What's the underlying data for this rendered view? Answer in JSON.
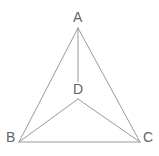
{
  "figure": {
    "background_color": "#ffffff",
    "line_color": "#9a9a9a",
    "label_color": "#646464",
    "line_width": 1,
    "labels": {
      "A": "A",
      "B": "B",
      "C": "C",
      "D": "D"
    },
    "points": {
      "A": {
        "x": 78,
        "y": 28
      },
      "B": {
        "x": 19,
        "y": 142
      },
      "C": {
        "x": 140,
        "y": 142
      },
      "D": {
        "x": 78,
        "y": 99
      }
    },
    "segments": [
      {
        "name": "AB",
        "from": "A",
        "to": "B"
      },
      {
        "name": "AC",
        "from": "A",
        "to": "C"
      },
      {
        "name": "BC",
        "from": "B",
        "to": "C"
      },
      {
        "name": "AD",
        "from": "A",
        "to": "D"
      },
      {
        "name": "DB",
        "from": "D",
        "to": "B"
      },
      {
        "name": "DC",
        "from": "D",
        "to": "C"
      }
    ]
  }
}
